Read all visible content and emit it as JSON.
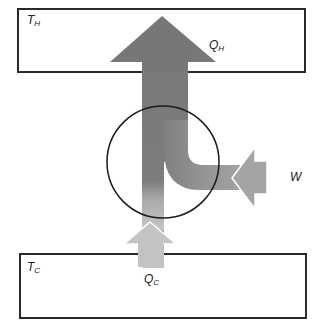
{
  "diagram": {
    "type": "heat-pump / refrigerator energy flow",
    "hot_reservoir": {
      "label_main": "T",
      "label_sub": "H"
    },
    "cold_reservoir": {
      "label_main": "T",
      "label_sub": "C"
    },
    "flows": {
      "q_hot": {
        "label_main": "Q",
        "label_sub": "H",
        "direction": "up",
        "color": "#7a7a7a"
      },
      "q_cold": {
        "label_main": "Q",
        "label_sub": "C",
        "direction": "up",
        "color": "#c4c4c4"
      },
      "work": {
        "label_main": "W",
        "direction": "left",
        "color": "#9f9f9f"
      }
    },
    "device": {
      "shape": "circle"
    }
  }
}
